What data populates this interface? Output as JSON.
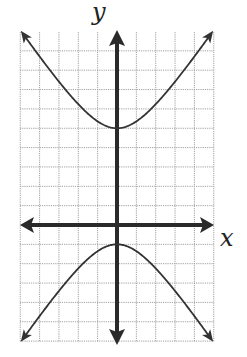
{
  "chart_data": {
    "type": "line",
    "title": "",
    "xlabel": "x",
    "ylabel": "y",
    "grid": true,
    "xlim": [
      -5,
      5
    ],
    "ylim": [
      -6,
      10
    ],
    "equation": "(y-2)^2/9 - x^2/4 = 1",
    "series": [
      {
        "name": "upper branch",
        "vertex": [
          0,
          5
        ],
        "x": [
          -4.9,
          -4,
          -3,
          -2,
          -1,
          0,
          1,
          2,
          3,
          4,
          4.9
        ],
        "y": [
          9.9,
          8.7,
          7.4,
          6.2,
          5.4,
          5,
          5.4,
          6.2,
          7.4,
          8.7,
          9.9
        ]
      },
      {
        "name": "lower branch",
        "vertex": [
          0,
          -1
        ],
        "x": [
          -4.9,
          -4,
          -3,
          -2,
          -1,
          0,
          1,
          2,
          3,
          4,
          4.9
        ],
        "y": [
          -5.9,
          -4.7,
          -3.4,
          -2.2,
          -1.4,
          -1,
          -1.4,
          -2.2,
          -3.4,
          -4.7,
          -5.9
        ]
      }
    ]
  },
  "labels": {
    "x_axis": "x",
    "y_axis": "y"
  },
  "colors": {
    "axis": "#2a2a2a",
    "curve": "#333333",
    "grid": "#9a9a9a"
  }
}
